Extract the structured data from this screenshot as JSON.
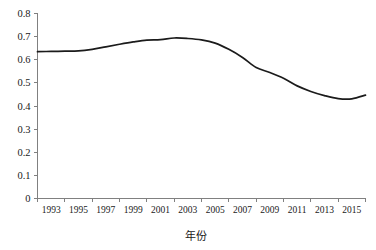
{
  "chart_data": {
    "type": "line",
    "title": "",
    "subtitle": "",
    "xlabel": "年份",
    "ylabel": "",
    "xlim": [
      1992,
      2016
    ],
    "ylim": [
      0,
      0.8
    ],
    "grid": false,
    "legend": false,
    "legend_position": "none",
    "line_color": "#1b1b1b",
    "axis_color": "#808080",
    "y_ticks": [
      "0",
      "0.1",
      "0.2",
      "0.3",
      "0.4",
      "0.5",
      "0.6",
      "0.7",
      "0.8"
    ],
    "y_tick_values": [
      0,
      0.1,
      0.2,
      0.3,
      0.4,
      0.5,
      0.6,
      0.7,
      0.8
    ],
    "x_ticks": [
      "1993",
      "1995",
      "1997",
      "1999",
      "2001",
      "2003",
      "2005",
      "2007",
      "2009",
      "2011",
      "2013",
      "2015"
    ],
    "x_tick_values": [
      1993,
      1995,
      1997,
      1999,
      2001,
      2003,
      2005,
      2007,
      2009,
      2011,
      2013,
      2015
    ],
    "x": [
      1992,
      1993,
      1994,
      1995,
      1996,
      1997,
      1998,
      1999,
      2000,
      2001,
      2002,
      2003,
      2004,
      2005,
      2006,
      2007,
      2008,
      2009,
      2010,
      2011,
      2012,
      2013,
      2014,
      2015,
      2016
    ],
    "series": [
      {
        "name": "值",
        "values": [
          0.635,
          0.636,
          0.637,
          0.638,
          0.645,
          0.656,
          0.667,
          0.677,
          0.685,
          0.687,
          0.694,
          0.692,
          0.686,
          0.672,
          0.645,
          0.61,
          0.566,
          0.545,
          0.52,
          0.487,
          0.463,
          0.445,
          0.432,
          0.431,
          0.447
        ]
      }
    ]
  }
}
